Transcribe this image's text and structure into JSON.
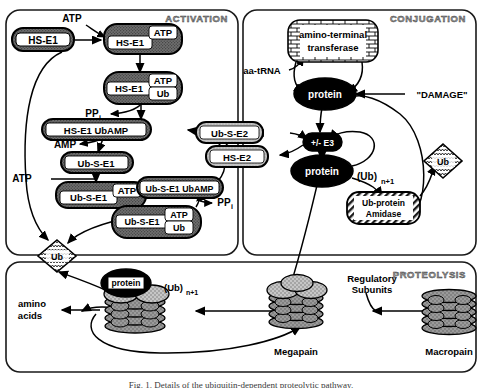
{
  "figure": {
    "caption": "Fig. 1. Details of the ubiquitin-dependent proteolytic pathway."
  },
  "panels": {
    "activation": {
      "label": "ACTIVATION"
    },
    "conjugation": {
      "label": "CONJUGATION"
    },
    "proteolysis": {
      "label": "PROTEOLYSIS"
    }
  },
  "activation": {
    "nodes": {
      "hs_e1": "HS-E1",
      "hs_e1_atp_main": "HS-E1",
      "hs_e1_atp_tag": "ATP",
      "hs_e1_atp_ub_main": "HS-E1",
      "hs_e1_atp_ub_tag1": "ATP",
      "hs_e1_atp_ub_tag2": "Ub",
      "hs_e1_ubamp": "HS-E1 UbAMP",
      "ub_s_e1": "Ub-S-E1",
      "ub_s_e1_atp_main": "Ub-S-E1",
      "ub_s_e1_atp_tag": "ATP",
      "ub_s_e1_ubamp": "Ub-S-E1 UbAMP",
      "ub_s_e1_atp_ub_main": "Ub-S-E1",
      "ub_s_e1_atp_ub_tag1": "ATP",
      "ub_s_e1_atp_ub_tag2": "Ub"
    },
    "labels": {
      "atp_top": "ATP",
      "atp_left": "ATP",
      "ppi_upper": "PP",
      "ppi_upper_sub": "i",
      "ppi_lower": "PP",
      "ppi_lower_sub": "i",
      "amp": "AMP"
    }
  },
  "conjugation": {
    "nodes": {
      "amino_terminal_transferase_line1": "amino-terminal",
      "amino_terminal_transferase_line2": "transferase",
      "protein_top": "protein",
      "protein_bottom": "protein",
      "e3": "+/- E3",
      "ub_s_e2": "Ub-S-E2",
      "hs_e2": "HS-E2",
      "amidase_line1": "Ub-protein",
      "amidase_line2": "Amidase"
    },
    "labels": {
      "aa_trna": "aa-tRNA",
      "damage": "\"DAMAGE\"",
      "ub_n1_paren": "(Ub)",
      "ub_n1_sub": "n+1"
    }
  },
  "shuttles": {
    "ub_left": "Ub",
    "ub_right": "Ub"
  },
  "proteolysis": {
    "labels": {
      "protein": "protein",
      "ub_n1_paren": "(Ub)",
      "ub_n1_sub": "n+1",
      "amino_line1": "amino",
      "amino_line2": "acids",
      "megapain": "Megapain",
      "macropain": "Macropain",
      "regulatory_line1": "Regulatory",
      "regulatory_line2": "Subunits"
    }
  },
  "colors": {
    "stroke": "#000000",
    "node_fill_dark": "#6e6e6e",
    "node_fill_light": "#c9c9c9",
    "node_fill_black": "#000000",
    "panel_border": "#1a1a1a",
    "panel_label": "#8a8a8a",
    "subunit_fill": "#8d8d8d",
    "subunit_cap": "#b5b5b5",
    "background": "#ffffff"
  }
}
